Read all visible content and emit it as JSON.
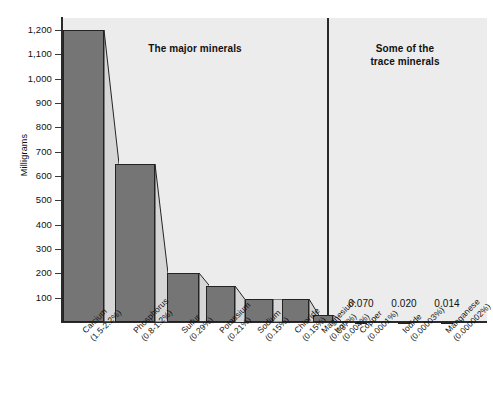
{
  "chart_data": {
    "type": "bar",
    "title": "",
    "xlabel": "",
    "ylabel": "Milligrams",
    "ylim": [
      0,
      1250
    ],
    "yticks": [
      "100",
      "200",
      "300",
      "400",
      "500",
      "600",
      "700",
      "800",
      "900",
      "1,000",
      "1,100",
      "1,200"
    ],
    "grid": false,
    "legend": null,
    "annotations": [
      {
        "text": "The major minerals",
        "region": "left"
      },
      {
        "text": "Some of the\ntrace minerals",
        "region": "right"
      }
    ],
    "region_labels": {
      "major": "The major minerals",
      "trace_line1": "Some of the",
      "trace_line2": "trace minerals"
    },
    "categories": [
      "Calcium",
      "Phosphorus",
      "Sulfur",
      "Potassium",
      "Sodium",
      "Chloride",
      "Magnesium",
      "Iron",
      "Copper",
      "Iodide",
      "Manganese"
    ],
    "category_percents": [
      "(1.5-2.2%)",
      "(0.8-1.2%)",
      "(0.29%)",
      "(0.21%)",
      "(0.15%)",
      "(0.15%)",
      "(0.037%)",
      "(0.004%)",
      "(0.0001%)",
      "(0.00003%)",
      "(0.000002%)"
    ],
    "values": [
      1200,
      650,
      200,
      150,
      95,
      95,
      27,
      4,
      0.07,
      0.02,
      0.014
    ],
    "value_labels": [
      "",
      "",
      "",
      "",
      "",
      "",
      "",
      "",
      "0.070",
      "0.020",
      "0.014"
    ],
    "groups": {
      "major": [
        "Calcium",
        "Phosphorus",
        "Sulfur",
        "Potassium",
        "Sodium",
        "Chloride",
        "Magnesium"
      ],
      "trace": [
        "Iron",
        "Copper",
        "Iodide",
        "Manganese"
      ]
    },
    "colors": {
      "bar_face": "#757575",
      "bar_side": "#d6d6d7",
      "plot_bg": "#ececed",
      "axis": "#2a2a2a",
      "text": "#111111"
    }
  }
}
